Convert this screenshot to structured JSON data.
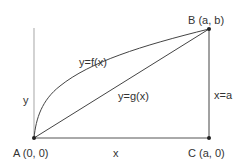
{
  "diagram": {
    "points": {
      "A": {
        "label": "A (0, 0)"
      },
      "B": {
        "label": "B (a, b)"
      },
      "C": {
        "label": "C (a, 0)"
      }
    },
    "axes": {
      "x_label": "x",
      "y_label": "y"
    },
    "curves": {
      "f": {
        "label": "y=f(x)"
      },
      "g": {
        "label": "y=g(x)"
      }
    },
    "vertical_line": {
      "label": "x=a"
    },
    "colors": {
      "line": "#333333",
      "axis": "#b0b0b0"
    }
  }
}
